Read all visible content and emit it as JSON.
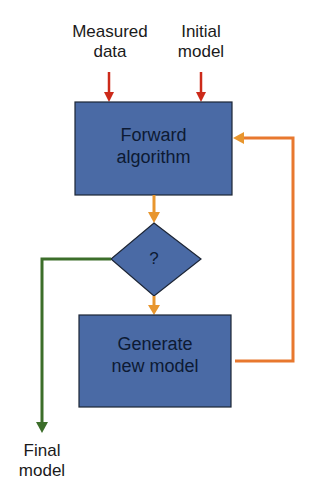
{
  "diagram": {
    "inputs": [
      {
        "id": "measured-data",
        "lines": [
          "Measured",
          "data"
        ]
      },
      {
        "id": "initial-model",
        "lines": [
          "Initial",
          "model"
        ]
      }
    ],
    "nodes": [
      {
        "id": "forward-algorithm",
        "shape": "rectangle",
        "lines": [
          "Forward",
          "algorithm"
        ]
      },
      {
        "id": "decision",
        "shape": "diamond",
        "label": "?"
      },
      {
        "id": "generate-new-model",
        "shape": "rectangle",
        "lines": [
          "Generate",
          "new model"
        ]
      }
    ],
    "outputs": [
      {
        "id": "final-model",
        "lines": [
          "Final",
          "model"
        ]
      }
    ],
    "edges": [
      {
        "from": "measured-data",
        "to": "forward-algorithm",
        "color": "#cc2a1a"
      },
      {
        "from": "initial-model",
        "to": "forward-algorithm",
        "color": "#cc2a1a"
      },
      {
        "from": "forward-algorithm",
        "to": "decision",
        "color": "#e8962e"
      },
      {
        "from": "decision",
        "to": "generate-new-model",
        "color": "#e8962e"
      },
      {
        "from": "generate-new-model",
        "to": "forward-algorithm",
        "color": "#e8782e"
      },
      {
        "from": "decision",
        "to": "final-model",
        "color": "#3c6e2a"
      }
    ],
    "colors": {
      "node_fill": "#4a6aa5",
      "node_border": "#1c2535",
      "input_arrow": "#cc2a1a",
      "flow_arrow": "#e8962e",
      "loop_arrow": "#e8782e",
      "exit_arrow": "#3c6e2a"
    }
  }
}
